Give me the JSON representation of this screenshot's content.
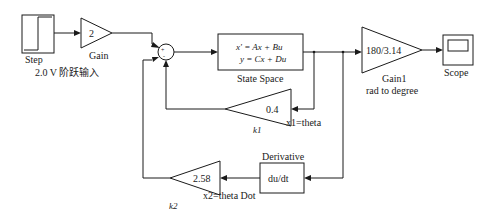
{
  "blocks": {
    "step": {
      "label": "Step",
      "caption": "2.0 V 阶跃输入"
    },
    "gain": {
      "value": "2",
      "label": "Gain"
    },
    "sum": {
      "signs": "+ + -"
    },
    "state_space": {
      "eq1": "x' = Ax + Bu",
      "eq2": "y = Cx + Du",
      "label": "State Space"
    },
    "gain1": {
      "value": "180/3.14",
      "label": "Gain1",
      "sublabel": "rad to degree"
    },
    "scope": {
      "label": "Scope"
    },
    "k1": {
      "value": "0.4",
      "label": "k1",
      "signal": "x1=theta"
    },
    "derivative": {
      "title": "Derivative",
      "expr": "du/dt"
    },
    "k2": {
      "value": "2.58",
      "label": "k2",
      "signal": "x2=theta Dot"
    }
  },
  "colors": {
    "line": "#1a1a1a",
    "background": "#ffffff"
  }
}
